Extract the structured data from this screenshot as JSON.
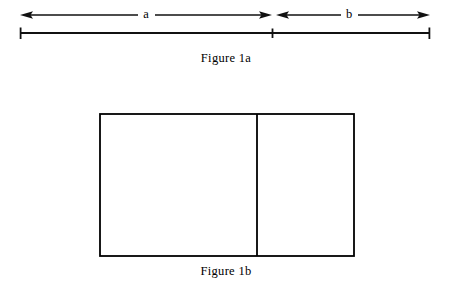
{
  "figure": {
    "background_color": "#ffffff",
    "stroke_color": "#000000",
    "panels": [
      {
        "id": "figure-1a",
        "caption": "Figure 1a",
        "type": "segmented-line-with-dimension-arrows",
        "segments": [
          {
            "label": "a",
            "start_x": 20,
            "end_x": 272,
            "length_px": 252
          },
          {
            "label": "b",
            "start_x": 272,
            "end_x": 430,
            "length_px": 158
          }
        ],
        "baseline_y": 33,
        "arrow_y": 15,
        "tick_positions": [
          20,
          272,
          430
        ]
      },
      {
        "id": "figure-1b",
        "caption": "Figure 1b",
        "type": "divided-rectangle",
        "rect": {
          "x": 100,
          "y": 114,
          "width": 254,
          "height": 142
        },
        "divider_x": 257,
        "parts": [
          {
            "corresponds_to": "a",
            "width_px": 157
          },
          {
            "corresponds_to": "b",
            "width_px": 97
          }
        ]
      }
    ],
    "labels": {
      "segment_a": "a",
      "segment_b": "b"
    },
    "captions": {
      "figure_1a": "Figure 1a",
      "figure_1b": "Figure 1b"
    }
  }
}
